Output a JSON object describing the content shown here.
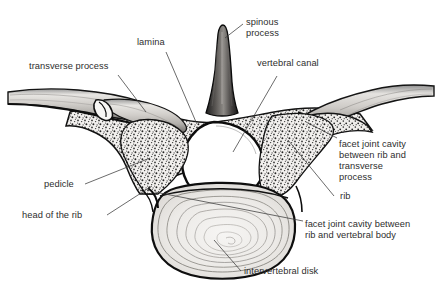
{
  "figure": {
    "style": "black-and-white anatomical line drawing with stippled cancellous bone",
    "background_color": "#ffffff",
    "ink_color": "#1a1a1a",
    "label_color": "#2e2e2e",
    "leader_color": "#3a3a3a"
  },
  "labels": {
    "transverse_process": "transverse process",
    "lamina": "lamina",
    "spinous_process_line1": "spinous",
    "spinous_process_line2": "process",
    "vertebral_canal": "vertebral canal",
    "facet_rib_transverse_line1": "facet joint cavity",
    "facet_rib_transverse_line2": "between rib and",
    "facet_rib_transverse_line3": "transverse",
    "facet_rib_transverse_line4": "process",
    "rib": "rib",
    "facet_rib_body_line1": "facet joint cavity between",
    "facet_rib_body_line2": "rib and vertebral body",
    "pedicle": "pedicle",
    "head_of_the_rib": "head of the rib",
    "intervertebral_disk": "intervertebral disk"
  }
}
